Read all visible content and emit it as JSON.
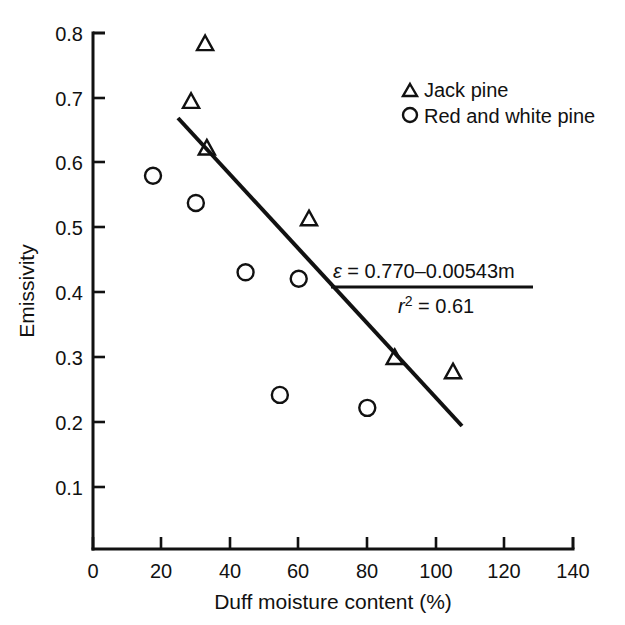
{
  "chart_data": {
    "type": "scatter",
    "title": "",
    "xlabel": "Duff moisture content (%)",
    "ylabel": "Emissivity",
    "xlim": [
      0,
      140
    ],
    "ylim": [
      0,
      0.8
    ],
    "xticks": [
      "0",
      "20",
      "40",
      "60",
      "80",
      "100",
      "120",
      "140"
    ],
    "xtick_values": [
      0,
      20,
      40,
      60,
      80,
      100,
      120,
      140
    ],
    "yticks": [
      "0.1",
      "0.2",
      "0.3",
      "0.4",
      "0.5",
      "0.6",
      "0.7",
      "0.8"
    ],
    "ytick_values": [
      0.1,
      0.2,
      0.3,
      0.4,
      0.5,
      0.6,
      0.7,
      0.8
    ],
    "grid": false,
    "legend_position": "top-right",
    "series": [
      {
        "name": "Jack pine",
        "marker": "triangle",
        "points": [
          {
            "x": 32.7,
            "y": 0.783
          },
          {
            "x": 28.6,
            "y": 0.694
          },
          {
            "x": 33.2,
            "y": 0.622
          },
          {
            "x": 63.0,
            "y": 0.513
          },
          {
            "x": 88.0,
            "y": 0.299
          },
          {
            "x": 105.0,
            "y": 0.277
          }
        ]
      },
      {
        "name": "Red and white pine",
        "marker": "circle",
        "points": [
          {
            "x": 17.5,
            "y": 0.58
          },
          {
            "x": 30.0,
            "y": 0.538
          },
          {
            "x": 44.5,
            "y": 0.431
          },
          {
            "x": 60.0,
            "y": 0.421
          },
          {
            "x": 54.5,
            "y": 0.242
          },
          {
            "x": 80.0,
            "y": 0.222
          }
        ]
      }
    ],
    "fit_line": {
      "equation_text": "ε = 0.770–0.00543m",
      "r2_text": "r2 = 0.61",
      "r_symbol": "r",
      "r_exponent": "2",
      "r_equals_value": "= 0.61",
      "intercept": 0.77,
      "slope": -0.00543,
      "r_squared": 0.61,
      "x_start": 25.0,
      "x_end": 107.6
    }
  },
  "legend": {
    "entries": [
      {
        "label": "Jack pine",
        "marker": "triangle"
      },
      {
        "label": "Red and white pine",
        "marker": "circle"
      }
    ]
  },
  "colors": {
    "ink": "#111111",
    "background": "#ffffff"
  }
}
